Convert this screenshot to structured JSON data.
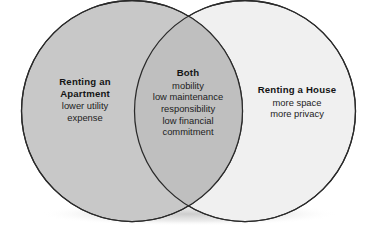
{
  "diagram": {
    "type": "venn",
    "background_color": "#ffffff",
    "stroke_color": "#2a2a2a",
    "text_color": "#171717",
    "left_fill": "#c8c8c8",
    "right_fill": "#f0f0f0",
    "overlap_fill": "#bdbdbd"
  },
  "left_set": {
    "heading": "Renting an",
    "heading_line2": "Apartment",
    "items": [
      "lower utility",
      "expense"
    ]
  },
  "center_set": {
    "heading": "Both",
    "items": [
      "mobility",
      "low maintenance",
      "responsibility",
      "low financial",
      "commitment"
    ]
  },
  "right_set": {
    "heading": "Renting a House",
    "items": [
      "more space",
      "more privacy"
    ]
  }
}
